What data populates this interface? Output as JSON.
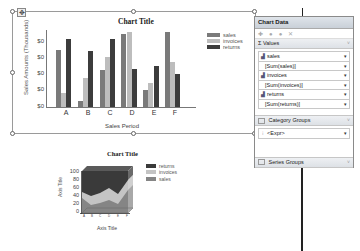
{
  "top_chart": {
    "title": "Chart Title",
    "ylabel": "Sales Amounts (Thousands)",
    "xlabel": "Sales Period",
    "y_ticks": [
      "$0",
      "$0",
      "$0",
      "$0",
      "$0"
    ],
    "move_handle_icon": "move-icon",
    "legend": [
      {
        "label": "sales",
        "color": "#7a7a7a"
      },
      {
        "label": "invoices",
        "color": "#bdbdbd"
      },
      {
        "label": "returns",
        "color": "#3c3c3c"
      }
    ]
  },
  "bottom_chart": {
    "title": "Chart Title",
    "ylabel": "Axis Title",
    "xlabel": "Axis Title",
    "y_ticks": [
      "100",
      "80",
      "60",
      "40",
      "20",
      "0"
    ],
    "legend": [
      {
        "label": "returns",
        "color": "#3a3a3a"
      },
      {
        "label": "invoices",
        "color": "#c4c4c4"
      },
      {
        "label": "sales",
        "color": "#858585"
      }
    ]
  },
  "chart_data": [
    {
      "type": "bar",
      "title": "Chart Title",
      "xlabel": "Sales Period",
      "ylabel": "Sales Amounts (Thousands)",
      "categories": [
        "A",
        "B",
        "C",
        "D",
        "E",
        "F"
      ],
      "series": [
        {
          "name": "sales",
          "values": [
            82,
            8,
            53,
            105,
            24,
            107
          ]
        },
        {
          "name": "invoices",
          "values": [
            20,
            42,
            72,
            107,
            34,
            64
          ]
        },
        {
          "name": "returns",
          "values": [
            97,
            80,
            97,
            55,
            58,
            47
          ]
        }
      ],
      "ylim": [
        0,
        110
      ],
      "y_tick_labels": [
        "$0",
        "$0",
        "$0",
        "$0",
        "$0"
      ],
      "legend_position": "right",
      "grid": false
    },
    {
      "type": "area",
      "stacked": "percent",
      "three_d": true,
      "title": "Chart Title",
      "xlabel": "Axis Title",
      "ylabel": "Axis Title",
      "categories": [
        "A",
        "B",
        "C",
        "D",
        "E",
        "F"
      ],
      "series": [
        {
          "name": "sales",
          "values": [
            35,
            15,
            25,
            35,
            22,
            50
          ]
        },
        {
          "name": "invoices",
          "values": [
            15,
            18,
            20,
            28,
            18,
            28
          ]
        },
        {
          "name": "returns",
          "values": [
            50,
            67,
            55,
            37,
            60,
            22
          ]
        }
      ],
      "ylim": [
        0,
        100
      ],
      "y_tick_labels": [
        "0",
        "20",
        "40",
        "60",
        "80",
        "100"
      ],
      "legend_position": "right"
    }
  ],
  "panel": {
    "title": "Chart Data",
    "toolbar": {
      "add_icon": "add-icon",
      "up_icon": "move-up-icon",
      "down_icon": "move-down-icon",
      "delete_icon": "delete-icon"
    },
    "values": {
      "header": "Σ Values",
      "items": [
        {
          "name": "sales",
          "expr": "[Sum(sales)]"
        },
        {
          "name": "invoices",
          "expr": "[Sum(invoices)]"
        },
        {
          "name": "returns",
          "expr": "[Sum(returns)]"
        }
      ]
    },
    "category_groups": {
      "header": "Category Groups",
      "items": [
        "<Expr>"
      ]
    },
    "series_groups": {
      "header": "Series Groups"
    }
  },
  "dropdown_glyph": "▾",
  "chevron_glyph": "˅"
}
